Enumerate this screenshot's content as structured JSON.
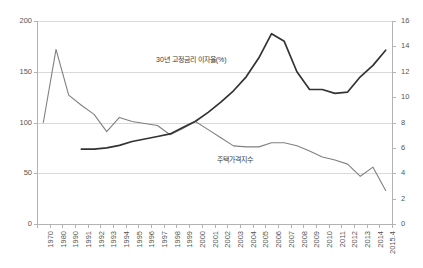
{
  "ghost_title": "",
  "chart_data": {
    "type": "line",
    "title": "",
    "xlabel": "",
    "grid": true,
    "legend_position": "inline-annotation",
    "categories": [
      "1970",
      "1980",
      "1990",
      "1991",
      "1992",
      "1993",
      "1994",
      "1995",
      "1996",
      "1997",
      "1998",
      "1999",
      "2000",
      "2001",
      "2002",
      "2003",
      "2004",
      "2005",
      "2006",
      "2007",
      "2008",
      "2009",
      "2010",
      "2011",
      "2012",
      "2013",
      "2014",
      "2015.4"
    ],
    "axes": {
      "left": {
        "label": "",
        "ylim": [
          0,
          200
        ],
        "ticks": [
          0,
          50,
          100,
          150,
          200
        ],
        "tick_labels": [
          "0",
          "50",
          "100",
          "150",
          "200"
        ]
      },
      "right": {
        "label": "",
        "ylim": [
          0,
          16
        ],
        "ticks": [
          0,
          2,
          4,
          6,
          8,
          10,
          12,
          14,
          16
        ],
        "tick_labels": [
          "0",
          "2",
          "4",
          "6",
          "8",
          "10",
          "12",
          "14",
          "16"
        ]
      }
    },
    "series": [
      {
        "name": "주택가격지수",
        "axis": "left",
        "color": "#808080",
        "annotation": "주택가격지수",
        "values": [
          100,
          172,
          127,
          117,
          108,
          91,
          105,
          101,
          99,
          97,
          88,
          94,
          101,
          93,
          85,
          77,
          76,
          76,
          80,
          80,
          77,
          72,
          66,
          63,
          59,
          47,
          56,
          50
        ]
      },
      {
        "name": "30년 고정금리 이자율(%)",
        "axis": "right",
        "color": "#333333",
        "annotation": "30년 고정금리 이자율(%)",
        "values": [
          null,
          null,
          null,
          5.9,
          5.9,
          6.0,
          6.2,
          6.5,
          6.7,
          6.9,
          7.1,
          7.6,
          8.1,
          8.8,
          9.6,
          10.5,
          11.6,
          13.1,
          15.0,
          14.4,
          12.0,
          10.6,
          10.6,
          10.3,
          10.4,
          11.6,
          12.5,
          13.7
        ]
      }
    ],
    "notes": [
      "주택가격지수 (left axis, index): 1970=100, peaks 172 in 1980, declines to 33 by 2015.4",
      "30년 고정금리 이자율(%) (right axis, percent): starts 5.9% in 1991, peaks 15.0% in 2006, ends 13.7% in 2015.4"
    ]
  },
  "series_price_values_right_tail": [
    80,
    77,
    72,
    66,
    63,
    59,
    47,
    56,
    50,
    33
  ]
}
